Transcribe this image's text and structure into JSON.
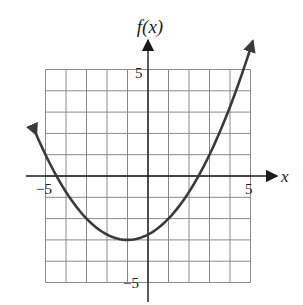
{
  "chart_data": {
    "type": "line",
    "title": "",
    "xlabel": "x",
    "ylabel": "f(x)",
    "xlim": [
      -5,
      5
    ],
    "ylim": [
      -5,
      5
    ],
    "grid": true,
    "grid_step": 1,
    "x_tick_labels": [
      {
        "value": -5,
        "label": "−5"
      },
      {
        "value": 5,
        "label": "5"
      }
    ],
    "y_tick_labels": [
      {
        "value": 5,
        "label": "5"
      },
      {
        "value": -5,
        "label": "−5"
      }
    ],
    "series": [
      {
        "name": "f(x)",
        "description": "Upward-opening parabola with arrows at both ends",
        "equation_estimate": "f(x) = 0.25(x+1)^2 - 3",
        "vertex": [
          -1,
          -3
        ],
        "x_intercepts": [
          -4.46,
          2.46
        ],
        "y_intercept": -2.75,
        "x": [
          -5.46,
          -5,
          -4.46,
          -4,
          -3,
          -2,
          -1,
          0,
          1,
          2,
          2.46,
          3,
          4,
          5,
          5.1
        ],
        "y": [
          1.97,
          1.0,
          0.0,
          -0.75,
          -2.0,
          -2.75,
          -3.0,
          -2.75,
          -2.0,
          -0.75,
          0.0,
          1.0,
          3.25,
          6.0,
          6.3
        ]
      }
    ],
    "legend": null
  },
  "labels": {
    "y_axis": "f(x)",
    "x_axis": "x",
    "y_top": "5",
    "y_bottom": "−5",
    "x_left": "−5",
    "x_right": "5"
  }
}
